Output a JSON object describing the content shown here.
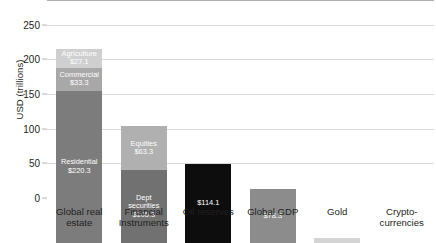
{
  "chart_data": {
    "type": "bar",
    "title": "",
    "xlabel": "",
    "ylabel": "USD (trillions)",
    "ylim": [
      0,
      280
    ],
    "yticks": [
      0,
      50,
      100,
      150,
      200,
      250
    ],
    "ytick_labels": [
      "0",
      "50",
      "100",
      "150",
      "200",
      "250"
    ],
    "grid": true,
    "legend": "none",
    "stacked": true,
    "categories": [
      "Global real estate",
      "Financial Instruments",
      "Oil reserves",
      "Global GDP",
      "Gold",
      "Crypto-currencies"
    ],
    "category_lines": [
      [
        "Global real",
        "estate"
      ],
      [
        "Financial",
        "Instruments"
      ],
      [
        "Oil reserves"
      ],
      [
        "Global GDP"
      ],
      [
        "Gold"
      ],
      [
        "Crypto-",
        "currencies"
      ]
    ],
    "bars": [
      {
        "category": "Global real estate",
        "total": 280.7,
        "segments": [
          {
            "name": "Residential",
            "value": 220.3,
            "label": "Residential",
            "value_label": "$220.3",
            "color": "#7c7c7c",
            "text_color": "light",
            "label_position": "inside"
          },
          {
            "name": "Commercial",
            "value": 33.3,
            "label": "Commercial",
            "value_label": "$33.3",
            "color": "#a8a8a8",
            "text_color": "light",
            "label_position": "inside"
          },
          {
            "name": "Agriculture",
            "value": 27.1,
            "label": "Agriculture",
            "value_label": "$27.1",
            "color": "#cfcfcf",
            "text_color": "light",
            "label_position": "inside"
          }
        ]
      },
      {
        "category": "Financial Instruments",
        "total": 168.6,
        "segments": [
          {
            "name": "Debt securities",
            "value": 105.3,
            "label": "Dept securities",
            "value_label": "$105.3",
            "color": "#717171",
            "text_color": "light",
            "label_position": "inside"
          },
          {
            "name": "Equities",
            "value": 63.3,
            "label": "Equities",
            "value_label": "$63.3",
            "color": "#b0b0b0",
            "text_color": "light",
            "label_position": "inside"
          }
        ]
      },
      {
        "category": "Oil reserves",
        "total": 114.1,
        "segments": [
          {
            "name": "Oil reserves",
            "value": 114.1,
            "label": "",
            "value_label": "$114.1",
            "color": "#0d0d0d",
            "text_color": "light",
            "label_position": "inside"
          }
        ]
      },
      {
        "category": "Global GDP",
        "total": 78.3,
        "segments": [
          {
            "name": "Global GDP",
            "value": 78.3,
            "label": "",
            "value_label": "$78.3",
            "color": "#8c8c8c",
            "text_color": "light",
            "label_position": "inside"
          }
        ]
      },
      {
        "category": "Gold",
        "total": 7.6,
        "segments": [
          {
            "name": "Gold",
            "value": 7.6,
            "label": "",
            "value_label": "$7.6",
            "color": "#d4d4d4",
            "text_color": "dark",
            "label_position": "above"
          }
        ]
      },
      {
        "category": "Crypto-currencies",
        "total": 0.5,
        "segments": [
          {
            "name": "Crypto-currencies",
            "value": 0.5,
            "label": "",
            "value_label": "$0.5",
            "color": "#d4d4d4",
            "text_color": "dark",
            "label_position": "above"
          }
        ]
      }
    ]
  }
}
